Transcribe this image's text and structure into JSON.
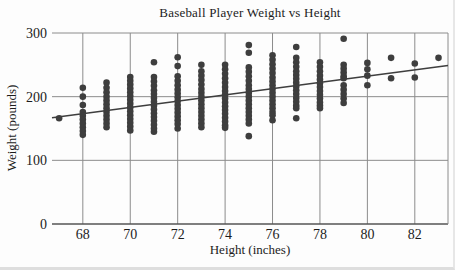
{
  "chart_data": {
    "type": "scatter",
    "title": "Baseball Player Weight vs Height",
    "xlabel": "Height (inches)",
    "ylabel": "Weight (pounds)",
    "xlim": [
      66.7,
      83.4
    ],
    "ylim": [
      0,
      300
    ],
    "x_ticks": [
      68,
      70,
      72,
      74,
      76,
      78,
      80,
      82
    ],
    "y_ticks": [
      0,
      100,
      200,
      300
    ],
    "grid": true,
    "legend": false,
    "colors": {
      "point": "#3e3e3e",
      "grid": "#8c8c8c",
      "axis": "#555555",
      "trend": "#3e3e3e",
      "text": "#1c1c1c"
    },
    "point_radius": 3.3,
    "trend_line": {
      "x_start": 66.7,
      "y_start": 167,
      "x_end": 83.4,
      "y_end": 249
    },
    "series": [
      {
        "name": "players",
        "columns": [
          {
            "height": 67,
            "weights": [
              166
            ]
          },
          {
            "height": 68,
            "weights": [
              214,
              200,
              187,
              176,
              170,
              164,
              158,
              152,
              146,
              140
            ]
          },
          {
            "height": 69,
            "weights": [
              222,
              214,
              207,
              200,
              194,
              188,
              182,
              176,
              170,
              164,
              158,
              152
            ]
          },
          {
            "height": 70,
            "weights": [
              231,
              225,
              219,
              213,
              207,
              201,
              195,
              189,
              183,
              177,
              171,
              165,
              159,
              153,
              147
            ]
          },
          {
            "height": 71,
            "weights": [
              254,
              231,
              224,
              217,
              210,
              204,
              198,
              192,
              186,
              180,
              174,
              168,
              162,
              156,
              150,
              145
            ]
          },
          {
            "height": 72,
            "weights": [
              262,
              248,
              232,
              225,
              218,
              211,
              205,
              199,
              193,
              187,
              181,
              175,
              169,
              163,
              157,
              150
            ]
          },
          {
            "height": 73,
            "weights": [
              250,
              240,
              233,
              226,
              219,
              212,
              206,
              200,
              194,
              188,
              182,
              176,
              170,
              164,
              158,
              152
            ]
          },
          {
            "height": 74,
            "weights": [
              250,
              243,
              236,
              229,
              222,
              215,
              209,
              203,
              197,
              191,
              185,
              179,
              173,
              167,
              161,
              155,
              151
            ]
          },
          {
            "height": 75,
            "weights": [
              281,
              269,
              246,
              239,
              232,
              225,
              218,
              212,
              206,
              200,
              194,
              188,
              182,
              176,
              170,
              164,
              158,
              138
            ]
          },
          {
            "height": 76,
            "weights": [
              265,
              258,
              251,
              244,
              237,
              230,
              224,
              218,
              212,
              206,
              200,
              194,
              188,
              182,
              176,
              171,
              163
            ]
          },
          {
            "height": 77,
            "weights": [
              278,
              261,
              254,
              247,
              240,
              234,
              228,
              222,
              216,
              210,
              204,
              198,
              192,
              186,
              182,
              166
            ]
          },
          {
            "height": 78,
            "weights": [
              254,
              247,
              240,
              233,
              227,
              221,
              215,
              209,
              203,
              197,
              191,
              186,
              182
            ]
          },
          {
            "height": 79,
            "weights": [
              291,
              250,
              244,
              238,
              232,
              229,
              218,
              211,
              204,
              197,
              190
            ]
          },
          {
            "height": 80,
            "weights": [
              253,
              243,
              233,
              218
            ]
          },
          {
            "height": 81,
            "weights": [
              261,
              229
            ]
          },
          {
            "height": 82,
            "weights": [
              252,
              230
            ]
          },
          {
            "height": 83,
            "weights": [
              261
            ]
          }
        ]
      }
    ]
  }
}
